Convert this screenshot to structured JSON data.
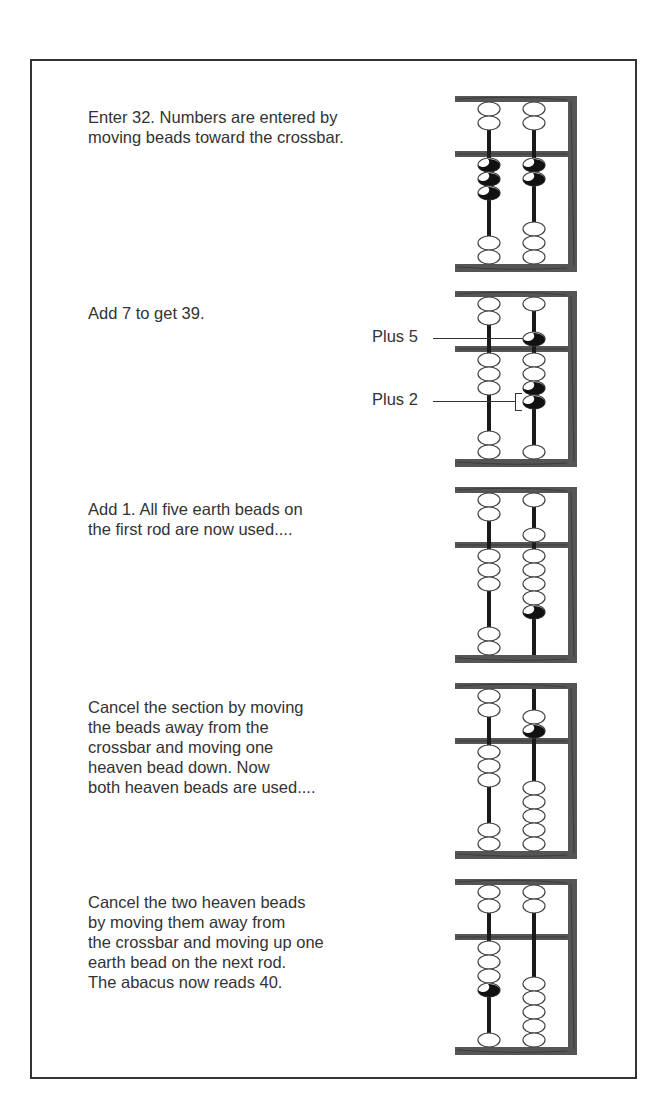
{
  "figure": {
    "frame_color": "#555555",
    "wood_grain_color": "#2a2a2a",
    "bead_shaded_color": "#111111",
    "rods": [
      "tens",
      "units"
    ],
    "steps": [
      {
        "id": 1,
        "text": "Enter 32. Numbers are entered by\nmoving beads toward the crossbar.",
        "value": 32,
        "rods": [
          {
            "heaven_active": 0,
            "earth_active": 3,
            "shaded_heaven": [],
            "shaded_earth": [
              0,
              1,
              2
            ]
          },
          {
            "heaven_active": 0,
            "earth_active": 2,
            "shaded_heaven": [],
            "shaded_earth": [
              0,
              1
            ]
          }
        ]
      },
      {
        "id": 2,
        "text": "Add 7 to get 39.",
        "value": 39,
        "callouts": [
          {
            "label": "Plus 5",
            "target": "units-heaven-bead"
          },
          {
            "label": "Plus 2",
            "target": "units-earth-beads-3-4"
          }
        ],
        "rods": [
          {
            "heaven_active": 0,
            "earth_active": 3,
            "shaded_heaven": [],
            "shaded_earth": []
          },
          {
            "heaven_active": 1,
            "earth_active": 4,
            "shaded_heaven": [
              0
            ],
            "shaded_earth": [
              2,
              3
            ]
          }
        ]
      },
      {
        "id": 3,
        "text": "Add 1. All five earth beads on\nthe first rod are now used....",
        "value": 40,
        "rods": [
          {
            "heaven_active": 0,
            "earth_active": 3,
            "shaded_heaven": [],
            "shaded_earth": []
          },
          {
            "heaven_active": 1,
            "earth_active": 5,
            "shaded_heaven": [],
            "shaded_earth": [
              4
            ]
          }
        ]
      },
      {
        "id": 4,
        "text": "Cancel the section by moving\nthe beads away from the\ncrossbar and moving one\nheaven bead down. Now\nboth heaven beads are used....",
        "value": 40,
        "rods": [
          {
            "heaven_active": 0,
            "earth_active": 3,
            "shaded_heaven": [],
            "shaded_earth": []
          },
          {
            "heaven_active": 2,
            "earth_active": 0,
            "shaded_heaven": [
              1
            ],
            "shaded_earth": []
          }
        ]
      },
      {
        "id": 5,
        "text": "Cancel the two heaven beads\nby moving them away from\nthe crossbar and moving up one\nearth bead on the next rod.\nThe abacus now reads 40.",
        "value": 40,
        "rods": [
          {
            "heaven_active": 0,
            "earth_active": 4,
            "shaded_heaven": [],
            "shaded_earth": [
              3
            ]
          },
          {
            "heaven_active": 0,
            "earth_active": 0,
            "shaded_heaven": [],
            "shaded_earth": []
          }
        ]
      }
    ]
  }
}
